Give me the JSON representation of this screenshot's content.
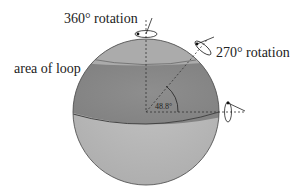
{
  "diagram": {
    "labels": {
      "rotation_360": "360° rotation",
      "rotation_270": "270° rotation",
      "area_of_loop": "area of loop",
      "angle": "48.8°"
    },
    "colors": {
      "cap_top": "#ababab",
      "loop_band": "#8a8a8a",
      "bottom": "#b8b8b8",
      "outline": "#555555",
      "dashed": "#333333",
      "text": "#222222"
    },
    "sphere": {
      "cx": 146,
      "cy": 112,
      "r": 73
    },
    "angle_deg": 48.8
  }
}
